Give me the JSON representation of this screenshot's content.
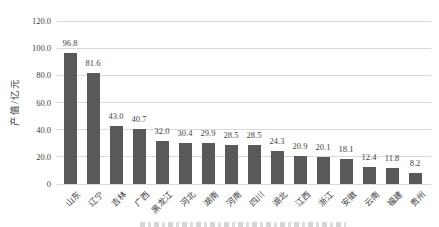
{
  "chart_data": {
    "type": "bar",
    "title": "",
    "ylabel": "产值/亿元",
    "xlabel": "",
    "categories": [
      "山东",
      "辽宁",
      "吉林",
      "广西",
      "黑龙江",
      "河北",
      "湖南",
      "河南",
      "四川",
      "湖北",
      "江西",
      "浙江",
      "安徽",
      "云南",
      "福建",
      "贵州"
    ],
    "values": [
      96.8,
      81.6,
      43.0,
      40.7,
      32.0,
      30.4,
      29.9,
      28.5,
      28.5,
      24.3,
      20.9,
      20.1,
      18.1,
      12.4,
      11.8,
      8.2
    ],
    "value_labels": [
      "96.8",
      "81.6",
      "43.0",
      "40.7",
      "32.0",
      "30.4",
      "29.9",
      "28.5",
      "28.5",
      "24.3",
      "20.9",
      "20.1",
      "18.1",
      "12.4",
      "11.8",
      "8.2"
    ],
    "ylim": [
      0,
      120
    ],
    "ytick_step": 20,
    "ytick_labels": [
      "0",
      "20.0",
      "40.0",
      "60.0",
      "80.0",
      "100.0",
      "120.0"
    ],
    "grid": true,
    "legend": false,
    "colors": {
      "bar": "#595959",
      "grid": "#d9d9d9",
      "text": "#3f3f3f",
      "background": "#ffffff"
    }
  }
}
